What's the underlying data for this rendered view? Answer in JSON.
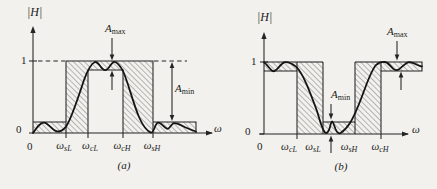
{
  "figure": {
    "panel_a": {
      "y_axis_label": "|H|",
      "tick_one": "1",
      "tick_zero_y": "0",
      "tick_zero_x": "0",
      "omega_axis_label": "ω",
      "freqs": [
        {
          "base": "ω",
          "sub": "sL"
        },
        {
          "base": "ω",
          "sub": "cL"
        },
        {
          "base": "ω",
          "sub": "cH"
        },
        {
          "base": "ω",
          "sub": "sH"
        }
      ],
      "a_max": {
        "base": "A",
        "sub": "max"
      },
      "a_min": {
        "base": "A",
        "sub": "min"
      },
      "caption": "(a)"
    },
    "panel_b": {
      "y_axis_label": "|H|",
      "tick_one": "1",
      "tick_zero_y": "0",
      "tick_zero_x": "0",
      "omega_axis_label": "ω",
      "freqs": [
        {
          "base": "ω",
          "sub": "cL"
        },
        {
          "base": "ω",
          "sub": "sL"
        },
        {
          "base": "ω",
          "sub": "sH"
        },
        {
          "base": "ω",
          "sub": "cH"
        }
      ],
      "a_max": {
        "base": "A",
        "sub": "max"
      },
      "a_min": {
        "base": "A",
        "sub": "min"
      },
      "caption": "(b)"
    }
  },
  "colors": {
    "paper": "#f2f1ed",
    "ink": "#242424",
    "curve_ink": "#141414",
    "hatch_line": "#4a4a4a"
  },
  "chart_data": [
    {
      "type": "line",
      "title": "Band-pass filter magnitude specification (a)",
      "xlabel": "ω",
      "ylabel": "|H|",
      "ylim": [
        0,
        1
      ],
      "y_reference_levels": {
        "passband_top": 1.0,
        "passband_ripple_bottom": 0.88,
        "stopband_max": 0.15,
        "zero": 0.0
      },
      "critical_frequencies_order": [
        "ω_sL",
        "ω_cL",
        "ω_cH",
        "ω_sH"
      ],
      "bands": {
        "lower_stopband": {
          "from": "0",
          "to": "ω_sL",
          "allowed_max": 0.15
        },
        "transition_1": {
          "from": "ω_sL",
          "to": "ω_cL"
        },
        "passband": {
          "from": "ω_cL",
          "to": "ω_cH",
          "ripple_band": [
            0.88,
            1.0
          ]
        },
        "transition_2": {
          "from": "ω_cH",
          "to": "ω_sH"
        },
        "upper_stopband": {
          "from": "ω_sH",
          "to": "end",
          "allowed_max": 0.15
        }
      },
      "render": {
        "hatched": [
          "M33,122 H66 V133 H33 Z",
          "M153,122 H196 V133 H153 Z",
          "M66,61 H153 V133 H123 V70 H88 V133 H66 Z"
        ],
        "solid": [
          "M33,133 V31",
          "M29,133 H212",
          "M29,61 H37",
          "M33,122 H66",
          "M153,122 H196 V133",
          "M66,133 V61 H153 V133",
          "M88,133 V70 H123 V133",
          "M66,133 V138",
          "M88,133 V138",
          "M123,133 V138",
          "M153,133 V138",
          "M112,38 V55",
          "M112,90 V75",
          "M172,66 V117"
        ],
        "dashed": [
          "M38,61 H65",
          "M154,61 H187"
        ],
        "curve": "M33,133 C37,127 40,122.6 44,122.6 C48,122.6 52,130.2 57,131.4 C60,132 63,130.2 66,126.6 C71,120 78,98 84,80 C88,69 91,63.6 95,62 C99,61.4 101,69.8 105,70.2 C109,70.4 111,62.2 114,61.8 C117,61.6 120,65.5 123,71 C128,82 133,103 139,117 C143,126 147,131.2 151,132.6 C154,133.2 155,123.2 158,122.7 C161,122.4 164,127.4 167,128.7 C170,129.7 171,123.6 174,123.1 C177,122.8 181,125.2 185,127.2 C189,129 192,130.4 196,131.5",
        "arrowheads": [
          "M33,26 L30.4,33 L35.6,33 Z",
          "M213,133 L206,130.4 L206,135.6 Z",
          "M112,60.5 L109.7,54.5 L114.3,54.5 Z",
          "M112,70.5 L109.7,76.5 L114.3,76.5 Z",
          "M172,62 L169.7,68 L174.3,68 Z",
          "M172,121 L169.7,115 L174.3,115 Z"
        ]
      }
    },
    {
      "type": "line",
      "title": "Band-stop filter magnitude specification (b)",
      "xlabel": "ω",
      "ylabel": "|H|",
      "ylim": [
        0,
        1
      ],
      "y_reference_levels": {
        "passband_top": 1.0,
        "passband_ripple_bottom": 0.88,
        "stopband_max": 0.15,
        "zero": 0.0
      },
      "critical_frequencies_order": [
        "ω_cL",
        "ω_sL",
        "ω_sH",
        "ω_cH"
      ],
      "bands": {
        "lower_passband": {
          "from": "0",
          "to": "ω_cL",
          "ripple_band": [
            0.88,
            1.0
          ]
        },
        "transition_1": {
          "from": "ω_cL",
          "to": "ω_sL"
        },
        "stopband": {
          "from": "ω_sL",
          "to": "ω_sH",
          "allowed_max": 0.15
        },
        "transition_2": {
          "from": "ω_sH",
          "to": "ω_cH"
        },
        "upper_passband": {
          "from": "ω_cH",
          "to": "end",
          "ripple_band": [
            0.88,
            1.0
          ]
        }
      },
      "render": {
        "hatched": [
          "M264,62 H297 V71 H264 Z",
          "M297,62 H323 V134 H297 Z",
          "M323,122 H355 V134 H323 Z",
          "M355,62 H381 V134 H355 Z",
          "M381,62 H422 V71 H381 Z"
        ],
        "solid": [
          "M264,134 V37",
          "M259,134 H408",
          "M260,62 H268",
          "M260,134 H264",
          "M264,62 H297",
          "M264,71 H297",
          "M297,62 V134",
          "M297,62 H323",
          "M323,62 V134",
          "M323,122 H355",
          "M355,62 V134",
          "M355,62 H381",
          "M381,62 V134",
          "M381,62 H422 V71 H381",
          "M297,134 V139",
          "M381,134 V139",
          "M331,104 V114",
          "M331,153 V141",
          "M397,41 V55",
          "M401,90 V77"
        ],
        "dashed": [],
        "curve": "M264,62.5 C267,63.8 270,70.2 273,71.2 C276,72 280,64.4 284,62.4 C288,61.4 292,63.6 296,66.6 C303,73 310,92 317,111 C320,121 322,129.4 325,132.6 C327,134.2 329,131 330,127 C330.6,124.4 331.4,121.4 332,121.4 C333,121.6 334,125 335.5,129 C337,132.6 339,134.2 341,132.8 C344,130.8 347,127.6 350,123 C354,116.6 359,104.6 364,91 C368,80 372,69.6 376,65 C379,62.2 382,61.6 385,62 C388,62.4 390,65.6 393,68.6 C395,70.4 397,70.6 399,69.3 C402,67.2 405,63.4 408,62.4 C411,61.8 414,63 417,64.8 C419,65.9 420.5,66.3 422,66.3",
        "arrowheads": [
          "M264,32 L261.4,39 L266.6,39 Z",
          "M409,134 L402,131.4 L402,136.6 Z",
          "M331,119.5 L328.7,113.5 L333.3,113.5 Z",
          "M331,135.5 L328.7,141.5 L333.3,141.5 Z",
          "M397,60.5 L394.7,54.5 L399.3,54.5 Z",
          "M401,71.5 L398.7,77.5 L403.3,77.5 Z"
        ]
      }
    }
  ]
}
